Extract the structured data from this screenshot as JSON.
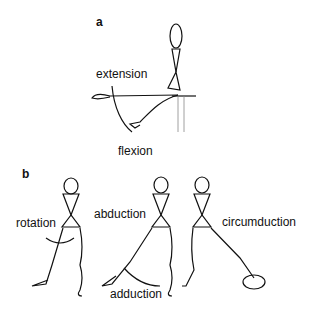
{
  "panels": [
    {
      "id": "a",
      "label": "a",
      "annotations": [
        "extension",
        "flexion"
      ]
    },
    {
      "id": "b",
      "label": "b",
      "annotations": [
        "rotation",
        "abduction",
        "adduction",
        "circumduction"
      ]
    }
  ],
  "colors": {
    "line": "#111111",
    "background": "#ffffff"
  }
}
